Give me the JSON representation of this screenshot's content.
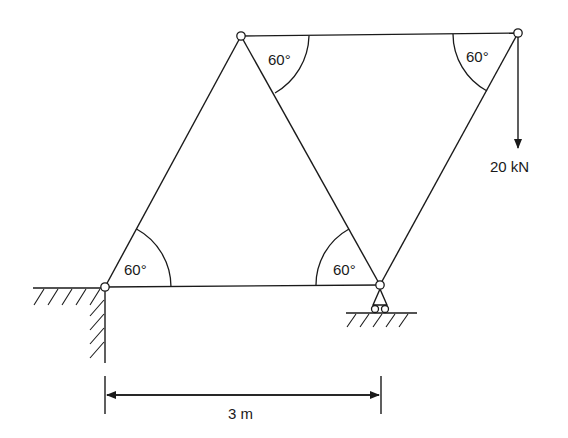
{
  "figure": {
    "type": "truss diagram",
    "nodes": [
      {
        "id": "A",
        "x": 105,
        "y": 287,
        "support": "pin"
      },
      {
        "id": "B",
        "x": 380,
        "y": 285,
        "support": "roller"
      },
      {
        "id": "C",
        "x": 241,
        "y": 36
      },
      {
        "id": "D",
        "x": 518,
        "y": 33
      }
    ],
    "members": [
      [
        "A",
        "B"
      ],
      [
        "A",
        "C"
      ],
      [
        "C",
        "B"
      ],
      [
        "C",
        "D"
      ],
      [
        "B",
        "D"
      ]
    ],
    "angles": [
      {
        "at": "A",
        "label": "60°"
      },
      {
        "at": "B",
        "label": "60°"
      },
      {
        "at": "C",
        "label": "60°"
      },
      {
        "at": "D",
        "label": "60°"
      }
    ],
    "load": {
      "at": "D",
      "direction": "down",
      "label": "20 kN"
    },
    "dimension": {
      "from": "A",
      "to": "B",
      "label": "3 m"
    }
  }
}
